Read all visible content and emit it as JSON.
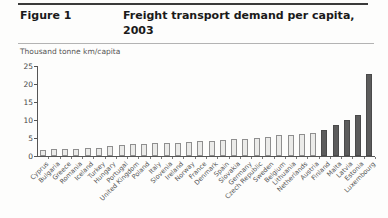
{
  "figure": {
    "label": "Figure 1",
    "title": "Freight transport demand per capita, 2003",
    "unit_label": "Thousand tonne km/capita"
  },
  "chart_data": {
    "type": "bar",
    "title": "Freight transport demand per capita, 2003",
    "ylabel": "Thousand tonne km/capita",
    "xlabel": "",
    "ylim": [
      0,
      25
    ],
    "yticks": [
      0,
      5,
      10,
      15,
      20,
      25
    ],
    "grid": false,
    "legend_position": "none",
    "categories": [
      "Cyprus",
      "Bulgaria",
      "Greece",
      "Romania",
      "Iceland",
      "Turkey",
      "Hungary",
      "Portugal",
      "United Kingdom",
      "Poland",
      "Italy",
      "Slovenia",
      "Ireland",
      "Norway",
      "France",
      "Denmark",
      "Spain",
      "Slovakia",
      "Germany",
      "Czech Republic",
      "Sweden",
      "Belgium",
      "Lithuania",
      "Netherlands",
      "Austria",
      "Finland",
      "Malta",
      "Latvia",
      "Estonia",
      "Luxembourg"
    ],
    "values": [
      1.8,
      1.9,
      1.9,
      2.0,
      2.1,
      2.2,
      2.9,
      3.0,
      3.3,
      3.4,
      3.5,
      3.6,
      3.7,
      3.9,
      4.1,
      4.3,
      4.5,
      4.6,
      4.8,
      5.0,
      5.4,
      5.7,
      5.9,
      6.1,
      6.4,
      7.2,
      8.5,
      9.9,
      11.3,
      22.8
    ],
    "dark_categories": [
      "Finland",
      "Malta",
      "Latvia",
      "Estonia",
      "Luxembourg"
    ],
    "colors": {
      "light_bar_fill": "#ebebe9",
      "light_bar_border": "#8f8f8f",
      "dark_bar_fill": "#5c5c5c",
      "axis": "#555555",
      "header_rule": "#3a3a3a"
    }
  }
}
